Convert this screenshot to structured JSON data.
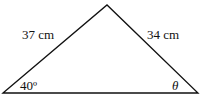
{
  "diagram": {
    "type": "triangle",
    "sides": {
      "left": "37 cm",
      "right": "34 cm"
    },
    "angles": {
      "bottom_left": "40º",
      "bottom_right": "θ"
    },
    "colors": {
      "stroke": "#111111",
      "text": "#111111",
      "background": "#ffffff"
    }
  }
}
